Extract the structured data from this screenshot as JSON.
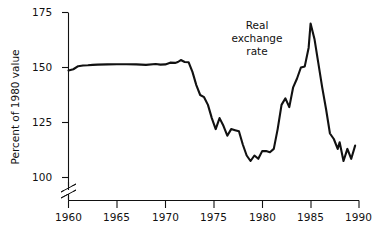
{
  "chart_data": {
    "type": "line",
    "title": "",
    "subtitle": "",
    "xlabel": "",
    "ylabel": "Percent of 1980 value",
    "xlim": [
      1960,
      1990
    ],
    "ylim": [
      93,
      175
    ],
    "yaxis_break": true,
    "yaxis_break_note": "axis broken between 0 and 100",
    "grid": false,
    "legend": "none",
    "xticks": [
      1960,
      1965,
      1970,
      1975,
      1980,
      1985,
      1990
    ],
    "xtick_labels": [
      "1960",
      "1965",
      "1970",
      "1975",
      "1980",
      "1985",
      "1990"
    ],
    "yticks": [
      100,
      125,
      150,
      175
    ],
    "ytick_labels": [
      "100",
      "125",
      "150",
      "175"
    ],
    "annotations": [
      {
        "name": "series-label",
        "text": "Real exchange rate",
        "line1": "Real",
        "line2": "exchange",
        "line3": "rate",
        "x": 1983.0,
        "y": 165
      }
    ],
    "series": [
      {
        "name": "Real exchange rate",
        "color": "#111111",
        "x": [
          1960.0,
          1960.5,
          1961.0,
          1961.5,
          1962.0,
          1962.5,
          1963.0,
          1964.0,
          1965.0,
          1966.0,
          1967.0,
          1968.0,
          1969.0,
          1969.5,
          1970.0,
          1970.5,
          1971.0,
          1971.3,
          1971.6,
          1972.0,
          1972.4,
          1972.8,
          1973.2,
          1973.6,
          1974.0,
          1974.4,
          1974.8,
          1975.2,
          1975.6,
          1976.0,
          1976.4,
          1976.8,
          1977.2,
          1977.6,
          1978.0,
          1978.4,
          1978.8,
          1979.2,
          1979.6,
          1980.0,
          1980.4,
          1980.8,
          1981.2,
          1981.6,
          1982.0,
          1982.4,
          1982.8,
          1983.2,
          1983.6,
          1984.0,
          1984.4,
          1984.8,
          1985.0,
          1985.4,
          1985.8,
          1986.2,
          1986.6,
          1987.0,
          1987.4,
          1987.8,
          1988.0,
          1988.4,
          1988.8,
          1989.2,
          1989.6
        ],
        "y": [
          148.6,
          149.2,
          150.6,
          150.9,
          151.0,
          151.2,
          151.3,
          151.4,
          151.5,
          151.5,
          151.4,
          151.2,
          151.6,
          151.3,
          151.4,
          152.2,
          152.1,
          152.5,
          153.4,
          152.5,
          152.4,
          148.0,
          142.0,
          137.5,
          136.5,
          133.0,
          127.0,
          122.0,
          127.0,
          123.5,
          119.0,
          122.0,
          121.5,
          121.0,
          115.0,
          110.0,
          107.5,
          110.0,
          108.5,
          112.0,
          112.0,
          111.5,
          113.0,
          122.0,
          133.0,
          136.0,
          132.0,
          141.0,
          145.0,
          150.0,
          150.5,
          159.0,
          170.0,
          163.0,
          152.0,
          141.0,
          131.0,
          120.0,
          117.5,
          113.0,
          116.0,
          107.5,
          113.0,
          108.5,
          114.5
        ]
      }
    ]
  },
  "axis": {
    "ylabel": "Percent of 1980 value"
  }
}
